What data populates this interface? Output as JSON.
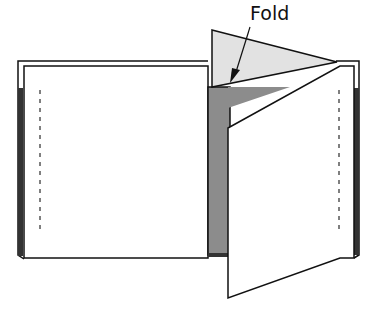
{
  "diagram": {
    "label": "Fold",
    "colors": {
      "line": "#111111",
      "fold_flap": "#e2e2e2",
      "inner_spread": "#8c8c8c",
      "page": "#ffffff",
      "spine_edge": "#333333"
    }
  }
}
